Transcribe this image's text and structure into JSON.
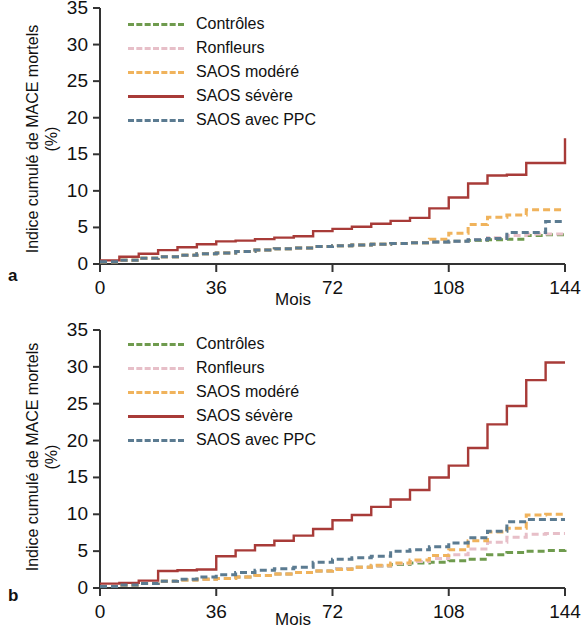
{
  "figure": {
    "panels": [
      {
        "letter": "a",
        "xlabel": "Mois",
        "ylabel": "Indice cumulé de MACE\nmortels (%)"
      },
      {
        "letter": "b",
        "xlabel": "Mois",
        "ylabel": "Indice cumulé de MACE\nmortels (%)"
      }
    ]
  },
  "legend": {
    "entries": [
      {
        "label": "Contrôles",
        "color": "#6f9b4e",
        "style": "dashed"
      },
      {
        "label": "Ronfleurs",
        "color": "#e7bfc8",
        "style": "dashed"
      },
      {
        "label": "SAOS modéré",
        "color": "#f0b35c",
        "style": "dashed"
      },
      {
        "label": "SAOS sévère",
        "color": "#a83b38",
        "style": "solid"
      },
      {
        "label": "SAOS avec PPC",
        "color": "#5b7b91",
        "style": "dashed"
      }
    ]
  },
  "chart_data": [
    {
      "type": "line",
      "panel": "a",
      "title": "",
      "xlabel": "Mois",
      "ylabel": "Indice cumulé de MACE mortels (%)",
      "xlim": [
        0,
        144
      ],
      "ylim": [
        0,
        35
      ],
      "xticks": [
        0,
        36,
        72,
        108,
        144
      ],
      "yticks": [
        0,
        5,
        10,
        15,
        20,
        25,
        30,
        35
      ],
      "grid": false,
      "legend_position": "top-left",
      "x": [
        0,
        6,
        12,
        18,
        24,
        30,
        36,
        42,
        48,
        54,
        60,
        66,
        72,
        78,
        84,
        90,
        96,
        102,
        108,
        114,
        120,
        126,
        132,
        138,
        144
      ],
      "series": [
        {
          "name": "Contrôles",
          "color": "#6f9b4e",
          "style": "dashed",
          "values": [
            0.3,
            0.5,
            0.8,
            1.0,
            1.2,
            1.4,
            1.5,
            1.7,
            1.9,
            2.1,
            2.2,
            2.4,
            2.5,
            2.6,
            2.7,
            2.8,
            2.9,
            3.0,
            3.1,
            3.2,
            3.3,
            3.4,
            3.9,
            4.0,
            4.0
          ]
        },
        {
          "name": "Ronfleurs",
          "color": "#e7bfc8",
          "style": "dashed",
          "values": [
            0.3,
            0.5,
            0.8,
            1.0,
            1.2,
            1.4,
            1.5,
            1.7,
            1.9,
            2.1,
            2.2,
            2.4,
            2.5,
            2.6,
            2.7,
            2.8,
            2.9,
            3.0,
            3.1,
            3.3,
            3.6,
            3.9,
            4.1,
            4.1,
            4.1
          ]
        },
        {
          "name": "SAOS modéré",
          "color": "#f0b35c",
          "style": "dashed",
          "values": [
            0.3,
            0.5,
            0.8,
            1.0,
            1.2,
            1.4,
            1.5,
            1.7,
            1.9,
            2.1,
            2.2,
            2.4,
            2.5,
            2.6,
            2.7,
            2.8,
            2.9,
            3.4,
            4.2,
            5.4,
            6.4,
            6.7,
            7.4,
            7.4,
            7.4
          ]
        },
        {
          "name": "SAOS sévère",
          "color": "#a83b38",
          "style": "solid",
          "values": [
            0.5,
            1.0,
            1.4,
            1.9,
            2.3,
            2.7,
            3.1,
            3.2,
            3.4,
            3.6,
            3.8,
            4.5,
            4.8,
            5.1,
            5.5,
            5.9,
            6.3,
            7.6,
            9.1,
            11.0,
            12.1,
            12.2,
            13.8,
            13.8,
            17.2
          ]
        },
        {
          "name": "SAOS avec PPC",
          "color": "#5b7b91",
          "style": "dashed",
          "values": [
            0.3,
            0.5,
            0.8,
            1.0,
            1.2,
            1.4,
            1.5,
            1.7,
            1.9,
            2.1,
            2.2,
            2.4,
            2.5,
            2.6,
            2.7,
            2.8,
            2.9,
            3.0,
            3.1,
            3.3,
            3.5,
            4.3,
            4.3,
            5.8,
            5.8
          ]
        }
      ]
    },
    {
      "type": "line",
      "panel": "b",
      "title": "",
      "xlabel": "Mois",
      "ylabel": "Indice cumulé de MACE mortels (%)",
      "xlim": [
        0,
        144
      ],
      "ylim": [
        0,
        35
      ],
      "xticks": [
        0,
        36,
        72,
        108,
        144
      ],
      "yticks": [
        0,
        5,
        10,
        15,
        20,
        25,
        30,
        35
      ],
      "grid": false,
      "legend_position": "top-left",
      "x": [
        0,
        6,
        12,
        18,
        24,
        30,
        36,
        42,
        48,
        54,
        60,
        66,
        72,
        78,
        84,
        90,
        96,
        102,
        108,
        114,
        120,
        126,
        132,
        138,
        144
      ],
      "series": [
        {
          "name": "Contrôles",
          "color": "#6f9b4e",
          "style": "dashed",
          "values": [
            0.2,
            0.4,
            0.6,
            0.9,
            1.1,
            1.2,
            1.3,
            1.5,
            1.7,
            1.9,
            2.1,
            2.3,
            2.6,
            2.8,
            3.0,
            3.2,
            3.4,
            3.5,
            3.7,
            3.9,
            4.5,
            4.8,
            5.0,
            5.1,
            5.2
          ]
        },
        {
          "name": "Ronfleurs",
          "color": "#e7bfc8",
          "style": "dashed",
          "values": [
            0.2,
            0.4,
            0.6,
            0.9,
            1.1,
            1.2,
            1.3,
            1.5,
            1.7,
            1.9,
            2.1,
            2.3,
            2.6,
            2.8,
            3.0,
            3.3,
            3.6,
            4.0,
            4.5,
            5.3,
            6.2,
            6.9,
            7.3,
            7.4,
            7.4
          ]
        },
        {
          "name": "SAOS modéré",
          "color": "#f0b35c",
          "style": "dashed",
          "values": [
            0.2,
            0.4,
            0.6,
            0.9,
            1.1,
            1.2,
            1.3,
            1.5,
            1.7,
            1.9,
            2.1,
            2.3,
            2.5,
            2.8,
            3.1,
            3.4,
            3.8,
            4.4,
            5.2,
            6.4,
            7.6,
            8.1,
            9.9,
            10.0,
            10.0
          ]
        },
        {
          "name": "SAOS sévère",
          "color": "#a83b38",
          "style": "solid",
          "values": [
            0.6,
            0.7,
            1.0,
            2.3,
            2.4,
            2.5,
            4.3,
            5.1,
            5.8,
            6.4,
            7.1,
            8.0,
            9.2,
            9.9,
            11.0,
            12.0,
            13.3,
            15.0,
            16.6,
            19.0,
            22.2,
            24.7,
            28.2,
            30.6,
            30.6
          ]
        },
        {
          "name": "SAOS avec PPC",
          "color": "#5b7b91",
          "style": "dashed",
          "values": [
            0.2,
            0.4,
            0.6,
            0.9,
            1.2,
            1.5,
            1.8,
            2.1,
            2.4,
            2.6,
            2.8,
            3.5,
            3.9,
            4.1,
            4.3,
            5.0,
            5.2,
            5.6,
            6.1,
            6.8,
            7.7,
            9.0,
            9.3,
            9.3,
            9.3
          ]
        }
      ]
    }
  ]
}
